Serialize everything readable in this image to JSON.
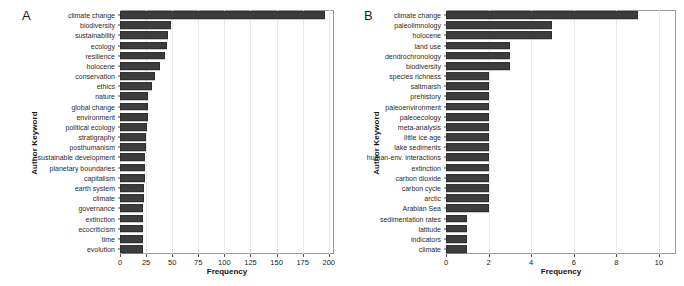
{
  "figure": {
    "background": "#ffffff",
    "bar_color": "#3d3d3d",
    "panel_border_color": "#9a9a9a",
    "gridline_color": "#e8e8e8"
  },
  "panels": [
    {
      "letter": "A",
      "ylabel": "Author Keyword",
      "xlabel": "Frequency"
    },
    {
      "letter": "B",
      "ylabel": "Author Keyword",
      "xlabel": "Frequency"
    }
  ],
  "chart_data": [
    {
      "type": "bar",
      "title": "A",
      "orientation": "horizontal",
      "xlabel": "Frequency",
      "ylabel": "Author Keyword",
      "xlim": [
        0,
        205
      ],
      "xticks": [
        0,
        25,
        50,
        75,
        100,
        125,
        150,
        175,
        200
      ],
      "grid": true,
      "legend": "none",
      "categories": [
        "climate change",
        "biodiversity",
        "sustainability",
        "ecology",
        "resilience",
        "holocene",
        "conservation",
        "ethics",
        "nature",
        "global change",
        "environment",
        "political ecology",
        "stratigraphy",
        "posthumanism",
        "sustainable development",
        "planetary boundaries",
        "capitalism",
        "earth system",
        "climate",
        "governance",
        "extinction",
        "ecocriticism",
        "time",
        "evolution"
      ],
      "values": [
        196,
        49,
        46,
        45,
        43,
        38,
        34,
        31,
        27,
        27,
        27,
        26,
        25,
        25,
        24,
        24,
        24,
        23,
        23,
        22,
        22,
        22,
        22,
        22
      ]
    },
    {
      "type": "bar",
      "title": "B",
      "orientation": "horizontal",
      "xlabel": "Frequency",
      "ylabel": "Author Keyword",
      "xlim": [
        0,
        10.8
      ],
      "xticks": [
        0,
        2,
        4,
        6,
        8,
        10
      ],
      "grid": true,
      "legend": "none",
      "categories": [
        "climate change",
        "paleolimnology",
        "holocene",
        "land use",
        "dendrochronology",
        "biodiversity",
        "species richness",
        "saltmarsh",
        "prehistory",
        "paleoenvironment",
        "paleoecology",
        "meta-analysis",
        "little ice age",
        "lake sediments",
        "human-env. interactions",
        "extinction",
        "carbon dioxide",
        "carbon cycle",
        "arctic",
        "Arabian Sea",
        "sedimentation rates",
        "latitude",
        "indicators",
        "climate"
      ],
      "values": [
        9,
        5,
        5,
        3,
        3,
        3,
        2,
        2,
        2,
        2,
        2,
        2,
        2,
        2,
        2,
        2,
        2,
        2,
        2,
        2,
        1,
        1,
        1,
        1
      ]
    }
  ]
}
